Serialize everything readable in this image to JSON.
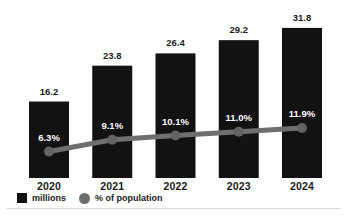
{
  "chart_data": {
    "type": "bar",
    "title": "",
    "xlabel": "",
    "ylabel": "",
    "grid": false,
    "legend_position": "bottom-left",
    "categories": [
      "2020",
      "2021",
      "2022",
      "2023",
      "2024"
    ],
    "series": [
      {
        "name": "millions",
        "kind": "bar",
        "values": [
          16.2,
          23.8,
          26.4,
          29.2,
          31.8
        ],
        "value_labels": [
          "16.2",
          "23.8",
          "26.4",
          "29.2",
          "31.8"
        ],
        "color": "#121212",
        "value_label_color": "#1b1b1b"
      },
      {
        "name": "% of population",
        "kind": "line",
        "values": [
          6.3,
          9.1,
          10.1,
          11.0,
          11.9
        ],
        "value_labels": [
          "6.3%",
          "9.1%",
          "10.1%",
          "11.0%",
          "11.9%"
        ],
        "color": "#6f6f6f",
        "marker_color": "#636363",
        "value_label_color": "#ffffff"
      }
    ],
    "legend_items": [
      {
        "label": "millions",
        "swatch": "square",
        "color": "#121212"
      },
      {
        "label": "% of population",
        "swatch": "circle",
        "color": "#6e6e6e"
      }
    ]
  }
}
